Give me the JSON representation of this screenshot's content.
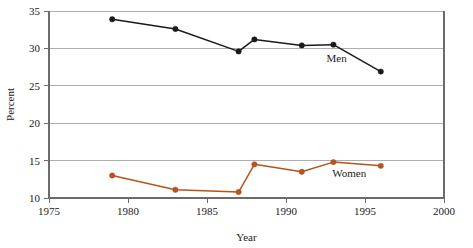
{
  "chart_data": {
    "type": "line",
    "title": "",
    "xlabel": "Year",
    "ylabel": "Percent",
    "xlim": [
      1975,
      2000
    ],
    "ylim": [
      10,
      35
    ],
    "xticks": [
      "1975",
      "1980",
      "1985",
      "1990",
      "1995",
      "2000"
    ],
    "xtick_values": [
      1975,
      1980,
      1985,
      1990,
      1995,
      2000
    ],
    "yticks": [
      "10",
      "15",
      "20",
      "25",
      "30",
      "35"
    ],
    "ytick_values": [
      10,
      15,
      20,
      25,
      30,
      35
    ],
    "grid": true,
    "grid_axis": "y",
    "legend_position": "inline-annotation",
    "series": [
      {
        "name": "Men",
        "color": "#1a1a1a",
        "marker": "circle",
        "x": [
          1979,
          1983,
          1987,
          1988,
          1991,
          1993,
          1996
        ],
        "values": [
          33.9,
          32.6,
          29.6,
          31.2,
          30.4,
          30.5,
          26.9
        ],
        "label": "Men",
        "label_x": 1993.2,
        "label_y": 28.2
      },
      {
        "name": "Women",
        "color": "#b5541e",
        "marker": "circle",
        "x": [
          1979,
          1983,
          1987,
          1988,
          1991,
          1993,
          1996
        ],
        "values": [
          13.0,
          11.1,
          10.8,
          14.5,
          13.5,
          14.8,
          14.3
        ],
        "label": "Women",
        "label_x": 1994.0,
        "label_y": 12.8
      }
    ]
  },
  "axes": {
    "x_axis_title": "Year",
    "y_axis_title": "Percent"
  }
}
